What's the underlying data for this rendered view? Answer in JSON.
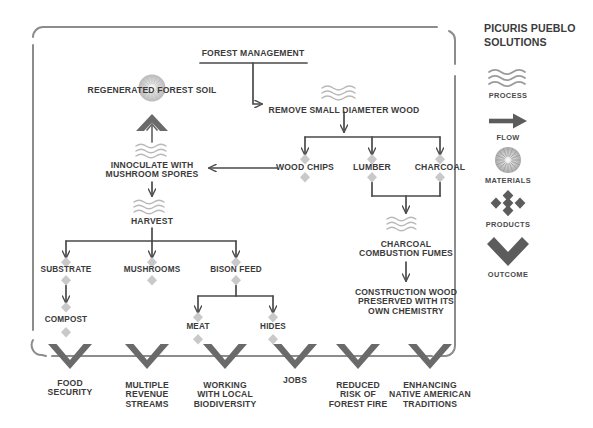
{
  "meta": {
    "title": "Picuris Pueblo Solutions",
    "diagram_type": "flow-diagram"
  },
  "legend": {
    "title": "PICURIS PUEBLO\nSOLUTIONS",
    "items": [
      {
        "icon": "waves-icon",
        "label": "PROCESS"
      },
      {
        "icon": "arrow-right-icon",
        "label": "FLOW"
      },
      {
        "icon": "burst-circle-icon",
        "label": "MATERIALS"
      },
      {
        "icon": "diamond-cluster-icon",
        "label": "PRODUCTS"
      },
      {
        "icon": "chevron-down-icon",
        "label": "OUTCOME"
      }
    ]
  },
  "nodes": {
    "forest_management": "FOREST MANAGEMENT",
    "regenerated_forest_soil": "REGENERATED FOREST SOIL",
    "remove_small_diameter_wood": "REMOVE SMALL DIAMETER WOOD",
    "innoculate_with_mushroom_spores": "INNOCULATE WITH\nMUSHROOM SPORES",
    "wood_chips": "WOOD CHIPS",
    "lumber": "LUMBER",
    "charcoal": "CHARCOAL",
    "harvest": "HARVEST",
    "substrate": "SUBSTRATE",
    "mushrooms": "MUSHROOMS",
    "bison_feed": "BISON FEED",
    "compost": "COMPOST",
    "meat": "MEAT",
    "hides": "HIDES",
    "charcoal_combustion_fumes": "CHARCOAL\nCOMBUSTION FUMES",
    "construction_wood": "CONSTRUCTION WOOD\nPRESERVED WITH ITS\nOWN CHEMISTRY"
  },
  "outcomes": [
    {
      "label": "FOOD\nSECURITY"
    },
    {
      "label": "MULTIPLE\nREVENUE\nSTREAMS"
    },
    {
      "label": "WORKING\nWITH LOCAL\nBIODIVERSITY"
    },
    {
      "label": "JOBS"
    },
    {
      "label": "REDUCED\nRISK OF\nFOREST FIRE"
    },
    {
      "label": "ENHANCING\nNATIVE AMERICAN\nTRADITIONS"
    }
  ],
  "colors": {
    "text": "#3b3b3b",
    "line": "#4a4a4a",
    "frame": "#8c8c8c",
    "product_diamond": "#c9c9c9",
    "chevron": "#6a6a6a",
    "waves": "#b4b4b4",
    "materials": "#c4c4c4"
  }
}
